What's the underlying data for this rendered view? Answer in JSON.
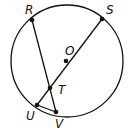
{
  "diagram": {
    "type": "circle-geometry",
    "stroke_color": "#111111",
    "background": "#ffffff",
    "circle": {
      "center": "O",
      "cx": 67,
      "cy": 61,
      "r": 56
    },
    "points": [
      {
        "name": "R",
        "x": 32,
        "y": 20,
        "label": "R",
        "lx": 25,
        "ly": 14
      },
      {
        "name": "S",
        "x": 102,
        "y": 19,
        "label": "S",
        "lx": 106,
        "ly": 14
      },
      {
        "name": "O",
        "x": 66,
        "y": 61,
        "label": "O",
        "lx": 65,
        "ly": 55
      },
      {
        "name": "T",
        "x": 50,
        "y": 88,
        "label": "T",
        "lx": 58,
        "ly": 94
      },
      {
        "name": "U",
        "x": 37,
        "y": 105,
        "label": "U",
        "lx": 26,
        "ly": 120
      },
      {
        "name": "V",
        "x": 56,
        "y": 112,
        "label": "V",
        "lx": 55,
        "ly": 128
      }
    ],
    "segments": [
      {
        "name": "RV",
        "from": "R",
        "to": "V"
      },
      {
        "name": "SU",
        "from": "S",
        "to": "U"
      },
      {
        "name": "UV",
        "from": "U",
        "to": "V"
      }
    ]
  }
}
